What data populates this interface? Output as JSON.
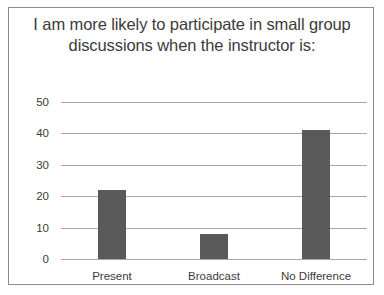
{
  "chart_data": {
    "type": "bar",
    "title": "I am more likely to participate in small group discussions when the instructor is:",
    "categories": [
      "Present",
      "Broadcast",
      "No Difference"
    ],
    "values": [
      22,
      8,
      41
    ],
    "xlabel": "",
    "ylabel": "",
    "ylim": [
      0,
      50
    ],
    "yticks": [
      50,
      40,
      30,
      20,
      10,
      0
    ],
    "grid": true,
    "legend": false,
    "colors": {
      "bar": "#595959",
      "gridline": "#a6a6a6",
      "text": "#3b3b3b",
      "border": "#8c8c8c",
      "background": "#ffffff"
    }
  }
}
